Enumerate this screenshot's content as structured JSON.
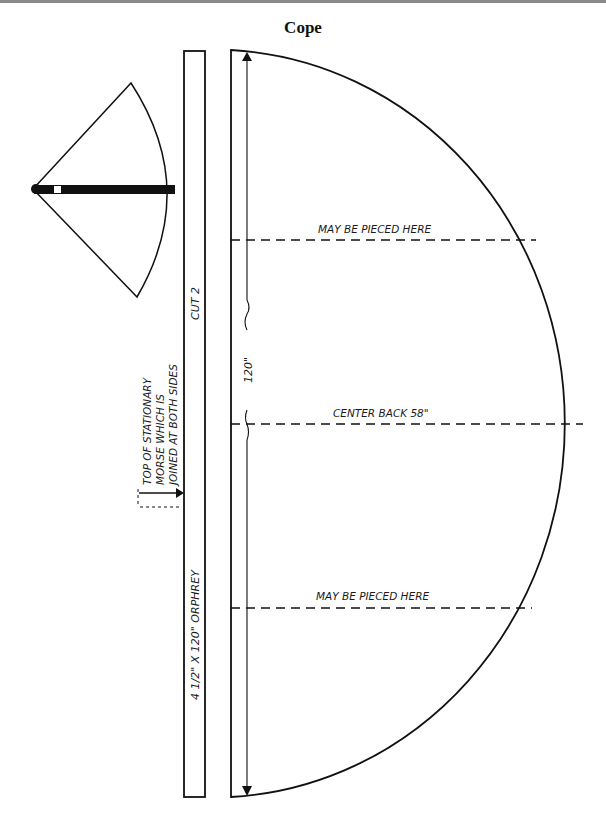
{
  "title": "Cope",
  "diagram": {
    "type": "sewing-pattern",
    "orphrey": {
      "label": "4 1/2\" X 120\" ORPHREY",
      "cut_label": "CUT 2"
    },
    "morse_note": {
      "line1": "TOP OF STATIONARY",
      "line2": "MORSE WHICH IS",
      "line3": "JOINED AT BOTH SIDES"
    },
    "cope_panel": {
      "length_label": "120\"",
      "piecing_top": "MAY BE PIECED HERE",
      "center_back": "CENTER BACK 58\"",
      "piecing_bottom": "MAY BE PIECED HERE"
    },
    "thumbnail": {
      "description": "Folded cope preview with orphrey band"
    },
    "colors": {
      "ink": "#111111",
      "paper": "#ffffff",
      "frame": "#8a8a8a"
    }
  }
}
